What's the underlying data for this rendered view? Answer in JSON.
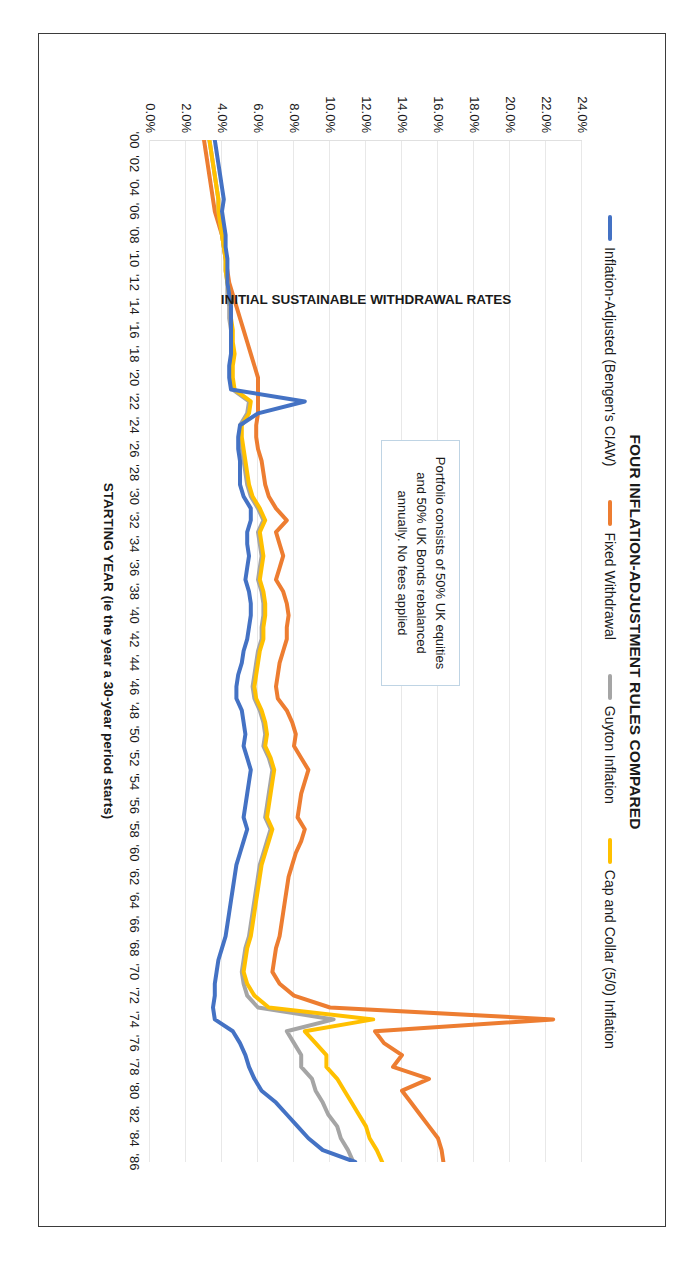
{
  "chart_data": {
    "type": "line",
    "title": "FOUR INFLATION-ADJUSTMENT RULES COMPARED",
    "xlabel": "STARTING YEAR (ie the year a 30-year period starts)",
    "ylabel": "INITIAL SUSTAINABLE WITHDRAWAL RATES",
    "ylim": [
      0,
      24
    ],
    "ytick_labels": [
      "0.0%",
      "2.0%",
      "4.0%",
      "6.0%",
      "8.0%",
      "10.0%",
      "12.0%",
      "14.0%",
      "16.0%",
      "18.0%",
      "20.0%",
      "22.0%",
      "24.0%"
    ],
    "ytick_values": [
      0,
      2,
      4,
      6,
      8,
      10,
      12,
      14,
      16,
      18,
      20,
      22,
      24
    ],
    "grid": true,
    "legend_position": "top",
    "xtick_labels": [
      "'00",
      "'02",
      "'04",
      "'06",
      "'08",
      "'10",
      "'12",
      "'14",
      "'16",
      "'18",
      "'20",
      "'22",
      "'24",
      "'26",
      "'28",
      "'30",
      "'32",
      "'34",
      "'36",
      "'38",
      "'40",
      "'42",
      "'44",
      "'46",
      "'48",
      "'50",
      "'52",
      "'54",
      "'56",
      "'58",
      "'60",
      "'62",
      "'64",
      "'66",
      "'68",
      "'70",
      "'72",
      "'74",
      "'76",
      "'78",
      "'80",
      "'82",
      "'84",
      "'86"
    ],
    "x": [
      1900,
      1901,
      1902,
      1903,
      1904,
      1905,
      1906,
      1907,
      1908,
      1909,
      1910,
      1911,
      1912,
      1913,
      1914,
      1915,
      1916,
      1917,
      1918,
      1919,
      1920,
      1921,
      1922,
      1923,
      1924,
      1925,
      1926,
      1927,
      1928,
      1929,
      1930,
      1931,
      1932,
      1933,
      1934,
      1935,
      1936,
      1937,
      1938,
      1939,
      1940,
      1941,
      1942,
      1943,
      1944,
      1945,
      1946,
      1947,
      1948,
      1949,
      1950,
      1951,
      1952,
      1953,
      1954,
      1955,
      1956,
      1957,
      1958,
      1959,
      1960,
      1961,
      1962,
      1963,
      1964,
      1965,
      1966,
      1967,
      1968,
      1969,
      1970,
      1971,
      1972,
      1973,
      1974,
      1975,
      1976,
      1977,
      1978,
      1979,
      1980,
      1981,
      1982,
      1983,
      1984,
      1985,
      1986
    ],
    "series": [
      {
        "name": "Inflation-Adjusted (Bengen's CIAW)",
        "color": "#4472C4",
        "values": [
          3.6,
          3.7,
          3.8,
          3.9,
          4.0,
          4.1,
          4.0,
          4.1,
          4.2,
          4.2,
          4.3,
          4.3,
          4.3,
          4.4,
          4.5,
          4.5,
          4.5,
          4.5,
          4.5,
          4.4,
          4.4,
          4.5,
          8.6,
          6.0,
          5.0,
          4.9,
          4.9,
          5.0,
          5.0,
          5.0,
          5.2,
          5.6,
          5.6,
          5.4,
          5.4,
          5.5,
          5.4,
          5.3,
          5.5,
          5.6,
          5.6,
          5.5,
          5.4,
          5.2,
          5.1,
          4.9,
          4.8,
          4.8,
          5.1,
          5.2,
          5.3,
          5.2,
          5.4,
          5.6,
          5.5,
          5.4,
          5.3,
          5.2,
          5.4,
          5.2,
          5.0,
          4.8,
          4.7,
          4.6,
          4.5,
          4.4,
          4.3,
          4.2,
          4.0,
          3.8,
          3.7,
          3.6,
          3.6,
          3.5,
          3.6,
          4.6,
          5.0,
          5.3,
          5.5,
          5.8,
          6.2,
          7.0,
          7.6,
          8.2,
          8.8,
          9.6,
          11.4
        ]
      },
      {
        "name": "Fixed Withdrawal",
        "color": "#ED7D31",
        "values": [
          3.0,
          3.1,
          3.2,
          3.3,
          3.4,
          3.5,
          3.6,
          3.8,
          4.0,
          4.1,
          4.2,
          4.3,
          4.4,
          4.6,
          4.8,
          5.0,
          5.2,
          5.4,
          5.6,
          5.8,
          6.0,
          6.0,
          6.0,
          6.0,
          5.9,
          5.9,
          6.0,
          6.2,
          6.3,
          6.4,
          6.6,
          7.0,
          7.6,
          7.0,
          7.2,
          7.4,
          7.2,
          7.0,
          7.4,
          7.6,
          7.7,
          7.6,
          7.6,
          7.4,
          7.2,
          7.1,
          7.0,
          7.1,
          7.6,
          7.9,
          8.1,
          8.0,
          8.4,
          8.8,
          8.6,
          8.4,
          8.3,
          8.2,
          8.6,
          8.4,
          8.1,
          7.9,
          7.7,
          7.6,
          7.5,
          7.4,
          7.3,
          7.2,
          7.0,
          6.9,
          6.8,
          7.2,
          8.0,
          10.0,
          22.4,
          12.5,
          13.0,
          14.0,
          13.5,
          15.5,
          14.0,
          14.5,
          15.0,
          15.5,
          16.0,
          16.2,
          16.3
        ]
      },
      {
        "name": "Guyton Inflation",
        "color": "#A5A5A5",
        "values": [
          3.3,
          3.4,
          3.5,
          3.6,
          3.7,
          3.8,
          3.8,
          3.9,
          4.0,
          4.1,
          4.2,
          4.2,
          4.3,
          4.3,
          4.4,
          4.4,
          4.5,
          4.5,
          4.6,
          4.5,
          4.5,
          4.6,
          5.5,
          5.4,
          5.0,
          5.0,
          5.1,
          5.2,
          5.3,
          5.4,
          5.6,
          6.0,
          6.3,
          6.0,
          6.1,
          6.2,
          6.1,
          6.0,
          6.2,
          6.3,
          6.3,
          6.2,
          6.2,
          6.0,
          5.9,
          5.8,
          5.7,
          5.8,
          6.1,
          6.3,
          6.4,
          6.3,
          6.6,
          6.8,
          6.7,
          6.6,
          6.5,
          6.4,
          6.7,
          6.5,
          6.3,
          6.1,
          6.0,
          5.9,
          5.8,
          5.7,
          5.6,
          5.5,
          5.3,
          5.2,
          5.1,
          5.2,
          5.4,
          6.0,
          10.2,
          7.6,
          8.0,
          8.4,
          8.4,
          9.0,
          9.2,
          9.6,
          9.9,
          10.4,
          10.6,
          11.0,
          11.3
        ]
      },
      {
        "name": "Cap and Collar (5/0) Inflation",
        "color": "#FFC000",
        "values": [
          3.3,
          3.4,
          3.5,
          3.6,
          3.7,
          3.8,
          3.8,
          3.9,
          4.0,
          4.1,
          4.2,
          4.2,
          4.3,
          4.4,
          4.5,
          4.5,
          4.6,
          4.6,
          4.7,
          4.6,
          4.6,
          4.7,
          5.6,
          5.5,
          5.1,
          5.1,
          5.2,
          5.3,
          5.4,
          5.5,
          5.7,
          6.1,
          6.4,
          6.1,
          6.2,
          6.3,
          6.2,
          6.1,
          6.3,
          6.4,
          6.4,
          6.3,
          6.3,
          6.1,
          6.0,
          5.9,
          5.8,
          5.9,
          6.2,
          6.4,
          6.5,
          6.4,
          6.7,
          6.9,
          6.8,
          6.7,
          6.6,
          6.5,
          6.8,
          6.6,
          6.4,
          6.2,
          6.1,
          6.0,
          5.9,
          5.8,
          5.7,
          5.6,
          5.4,
          5.3,
          5.2,
          5.4,
          5.8,
          6.6,
          12.4,
          8.6,
          9.2,
          9.8,
          9.8,
          10.4,
          10.8,
          11.2,
          11.6,
          12.0,
          12.2,
          12.6,
          12.9
        ]
      }
    ],
    "annotation": "Portfolio consists of 50% UK equities and 50% UK Bonds rebalanced annually.  No fees applied"
  }
}
